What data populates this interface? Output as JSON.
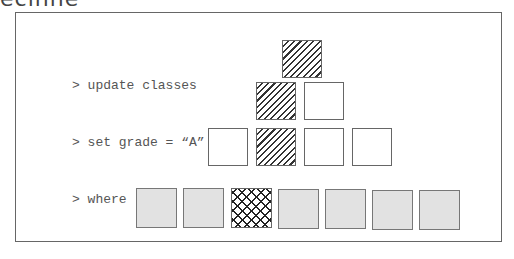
{
  "header_fragment": "ecinne",
  "code": {
    "lines": [
      "> update classes",
      "> set grade = “A”",
      "> where ..."
    ]
  },
  "pyramid": {
    "row1": [
      "hatched"
    ],
    "row2": [
      "hatched",
      "empty"
    ],
    "row3": [
      "empty",
      "hatched",
      "empty",
      "empty"
    ]
  },
  "bottom_row": [
    "grey",
    "grey",
    "crosshatched",
    "grey",
    "grey",
    "grey",
    "grey"
  ],
  "colors": {
    "border": "#666666",
    "grey_fill": "#e2e2e2",
    "hatch": "#333333"
  }
}
